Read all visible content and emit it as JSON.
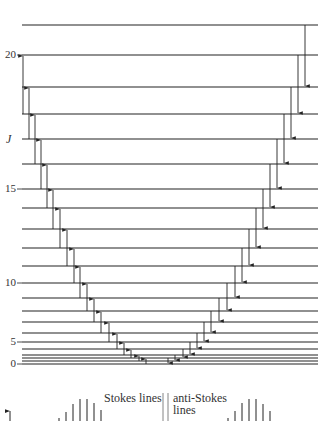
{
  "figure": {
    "y_axis_label": "J",
    "tick_labels": [
      {
        "text": "20",
        "y": 55
      },
      {
        "text": "15",
        "y": 189
      },
      {
        "text": "10",
        "y": 283
      },
      {
        "text": "5",
        "y": 342
      },
      {
        "text": "0",
        "y": 364
      }
    ],
    "levels_y": [
      25,
      55,
      87,
      114,
      139,
      164,
      189,
      208,
      229,
      248,
      266,
      283,
      298,
      311,
      322,
      333,
      342,
      349,
      355,
      358,
      361,
      364
    ],
    "stokes_arrows": [
      {
        "x": 23,
        "y_from": 114,
        "y_to": 55
      },
      {
        "x": 29,
        "y_from": 139,
        "y_to": 87
      },
      {
        "x": 35,
        "y_from": 164,
        "y_to": 114
      },
      {
        "x": 41,
        "y_from": 189,
        "y_to": 139
      },
      {
        "x": 47,
        "y_from": 208,
        "y_to": 164
      },
      {
        "x": 53,
        "y_from": 229,
        "y_to": 189
      },
      {
        "x": 60,
        "y_from": 248,
        "y_to": 208
      },
      {
        "x": 67,
        "y_from": 266,
        "y_to": 229
      },
      {
        "x": 74,
        "y_from": 283,
        "y_to": 248
      },
      {
        "x": 80,
        "y_from": 298,
        "y_to": 266
      },
      {
        "x": 87,
        "y_from": 311,
        "y_to": 283
      },
      {
        "x": 94,
        "y_from": 322,
        "y_to": 298
      },
      {
        "x": 101,
        "y_from": 333,
        "y_to": 311
      },
      {
        "x": 109,
        "y_from": 342,
        "y_to": 322
      },
      {
        "x": 117,
        "y_from": 349,
        "y_to": 333
      },
      {
        "x": 124,
        "y_from": 355,
        "y_to": 342
      },
      {
        "x": 131,
        "y_from": 358,
        "y_to": 349
      },
      {
        "x": 139,
        "y_from": 361,
        "y_to": 355
      },
      {
        "x": 146,
        "y_from": 364,
        "y_to": 358
      }
    ],
    "anti_stokes_arrows": [
      {
        "x": 168,
        "y_from": 358,
        "y_to": 364
      },
      {
        "x": 175,
        "y_from": 355,
        "y_to": 361
      },
      {
        "x": 183,
        "y_from": 349,
        "y_to": 358
      },
      {
        "x": 190,
        "y_from": 342,
        "y_to": 355
      },
      {
        "x": 197,
        "y_from": 333,
        "y_to": 349
      },
      {
        "x": 204,
        "y_from": 322,
        "y_to": 342
      },
      {
        "x": 211,
        "y_from": 311,
        "y_to": 333
      },
      {
        "x": 219,
        "y_from": 298,
        "y_to": 322
      },
      {
        "x": 227,
        "y_from": 283,
        "y_to": 311
      },
      {
        "x": 235,
        "y_from": 266,
        "y_to": 298
      },
      {
        "x": 242,
        "y_from": 248,
        "y_to": 283
      },
      {
        "x": 249,
        "y_from": 229,
        "y_to": 266
      },
      {
        "x": 256,
        "y_from": 208,
        "y_to": 248
      },
      {
        "x": 263,
        "y_from": 189,
        "y_to": 229
      },
      {
        "x": 270,
        "y_from": 164,
        "y_to": 208
      },
      {
        "x": 277,
        "y_from": 139,
        "y_to": 189
      },
      {
        "x": 284,
        "y_from": 114,
        "y_to": 164
      },
      {
        "x": 291,
        "y_from": 87,
        "y_to": 139
      },
      {
        "x": 298,
        "y_from": 55,
        "y_to": 114
      },
      {
        "x": 305,
        "y_from": 25,
        "y_to": 87
      }
    ],
    "spectrum": {
      "stokes_label": "Stokes lines",
      "anti_stokes_label_1": "anti-Stokes",
      "anti_stokes_label_2": "lines",
      "stokes_lines": [
        {
          "x": 59,
          "h": 3
        },
        {
          "x": 66,
          "h": 9
        },
        {
          "x": 73,
          "h": 17
        },
        {
          "x": 80,
          "h": 22
        },
        {
          "x": 87,
          "h": 22
        },
        {
          "x": 94,
          "h": 18
        },
        {
          "x": 101,
          "h": 11
        }
      ],
      "anti_stokes_lines": [
        {
          "x": 228,
          "h": 3
        },
        {
          "x": 235,
          "h": 10
        },
        {
          "x": 242,
          "h": 18
        },
        {
          "x": 249,
          "h": 22
        },
        {
          "x": 256,
          "h": 22
        },
        {
          "x": 263,
          "h": 17
        },
        {
          "x": 270,
          "h": 10
        }
      ],
      "rayleigh_x": [
        163,
        168
      ]
    },
    "colors": {
      "ink": "#222222",
      "background": "#ffffff"
    }
  }
}
